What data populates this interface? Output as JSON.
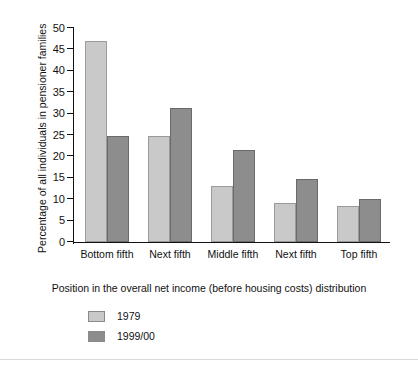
{
  "chart_data": {
    "type": "bar",
    "title": "",
    "xlabel": "Position in the overall net income (before housing costs) distribution",
    "ylabel": "Percentage of all individuals in pensioner families",
    "categories": [
      "Bottom fifth",
      "Next fifth",
      "Middle fifth",
      "Next fifth",
      "Top fifth"
    ],
    "series": [
      {
        "name": "1979",
        "color": "#c9c9c9",
        "values": [
          47,
          24.7,
          13,
          9,
          8.5
        ]
      },
      {
        "name": "1999/00",
        "color": "#8d8d8d",
        "values": [
          24.8,
          31.2,
          21.5,
          14.7,
          10
        ]
      }
    ],
    "ylim": [
      0,
      50
    ],
    "yticks": [
      0,
      5,
      10,
      15,
      20,
      25,
      30,
      35,
      40,
      45,
      50
    ],
    "grid": false,
    "legend_position": "bottom-left"
  }
}
